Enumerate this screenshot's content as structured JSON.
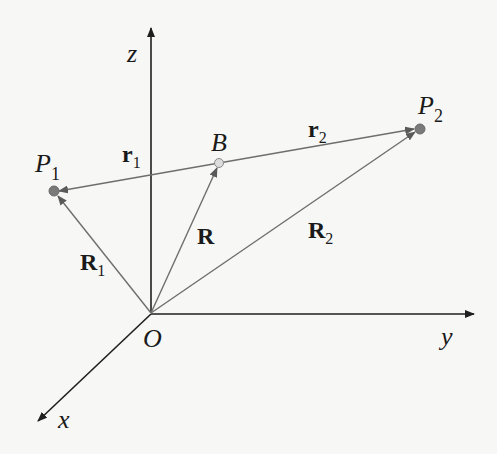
{
  "diagram": {
    "type": "3D vector diagram",
    "axes": {
      "x_label": "x",
      "y_label": "y",
      "z_label": "z",
      "origin_label": "O"
    },
    "points": [
      {
        "id": "P1",
        "label": "P",
        "subscript": "1"
      },
      {
        "id": "B",
        "label": "B"
      },
      {
        "id": "P2",
        "label": "P",
        "subscript": "2"
      }
    ],
    "vectors": [
      {
        "id": "R1",
        "label": "R",
        "subscript": "1",
        "from": "O",
        "to": "P1"
      },
      {
        "id": "R",
        "label": "R",
        "subscript": "",
        "from": "O",
        "to": "B"
      },
      {
        "id": "R2",
        "label": "R",
        "subscript": "2",
        "from": "O",
        "to": "P2"
      },
      {
        "id": "r1",
        "label": "r",
        "subscript": "1",
        "from": "B",
        "to": "P1"
      },
      {
        "id": "r2",
        "label": "r",
        "subscript": "2",
        "from": "B",
        "to": "P2"
      }
    ]
  },
  "colors": {
    "axis": "#1f1f1f",
    "vector": "#6e6e6e",
    "point_fill": "#7a7a7a",
    "point_b_fill": "#d8d8d8"
  }
}
